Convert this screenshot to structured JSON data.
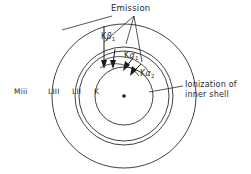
{
  "figure": {
    "kind": "atomic-shell-emission-diagram",
    "background_color": "#ffffff",
    "line_color": "#2b2b2b",
    "text_color": "#2b2b2b"
  },
  "shells": [
    {
      "id": "m3",
      "label": "Miii",
      "label_x": 14,
      "label_y": 88,
      "cx": 124,
      "cy": 96,
      "r": 72
    },
    {
      "id": "l3",
      "label": "LIII",
      "label_x": 48,
      "label_y": 88,
      "cx": 124,
      "cy": 96,
      "r": 49
    },
    {
      "id": "l2",
      "label": "LII",
      "label_x": 72,
      "label_y": 88,
      "cx": 124,
      "cy": 96,
      "r": 45
    },
    {
      "id": "k",
      "label": "K",
      "label_x": 94,
      "label_y": 88,
      "cx": 124,
      "cy": 96,
      "r": 29
    }
  ],
  "nucleus": {
    "cx": 124,
    "cy": 96,
    "r": 1.8
  },
  "annotations": {
    "emission": {
      "text": "Emission",
      "x": 111,
      "y": 4
    },
    "ionization": {
      "line1": "Ionization of",
      "line2": "inner shell",
      "x": 185,
      "y": 80
    }
  },
  "transitions": [
    {
      "id": "kbeta1",
      "series": "K",
      "greek": "β",
      "sub": "1",
      "label_x": 101,
      "label_y": 33
    },
    {
      "id": "kalpha1",
      "series": "K",
      "greek": "α",
      "sub": "1",
      "label_x": 124,
      "label_y": 52
    },
    {
      "id": "kalpha2",
      "series": "K",
      "greek": "α",
      "sub": "2",
      "label_x": 140,
      "label_y": 70
    }
  ]
}
